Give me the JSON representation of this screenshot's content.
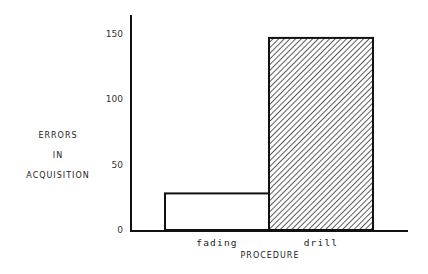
{
  "chart_data": {
    "type": "bar",
    "title": "",
    "xlabel": "PROCEDURE",
    "ylabel_lines": [
      "ERRORS",
      "IN",
      "ACQUISITION"
    ],
    "categories": [
      "fading",
      "drill"
    ],
    "values": [
      28,
      147
    ],
    "bar_fills": [
      "none",
      "hatched"
    ],
    "yticks": [
      0,
      50,
      100,
      150
    ],
    "ylim": [
      0,
      160
    ],
    "grid": false,
    "legend": "none"
  }
}
